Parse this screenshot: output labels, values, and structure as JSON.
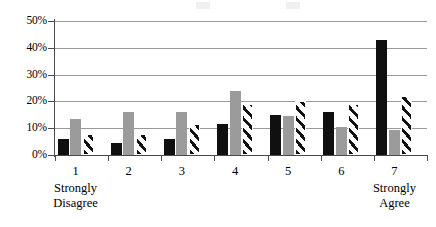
{
  "chart_data": {
    "type": "bar",
    "title": "",
    "subtitle": "",
    "xlabel": "",
    "ylabel": "",
    "categories": [
      "1",
      "2",
      "3",
      "4",
      "5",
      "6",
      "7"
    ],
    "category_endpoint_labels": {
      "low": "Strongly\nDisagree",
      "low_line1": "Strongly",
      "low_line2": "Disagree",
      "high_line1": "Strongly",
      "high_line2": "Agree"
    },
    "ylim": [
      0,
      50
    ],
    "ytick_labels": [
      "0%",
      "10%",
      "20%",
      "30%",
      "40%",
      "50%"
    ],
    "ytick_values": [
      0,
      10,
      20,
      30,
      40,
      50
    ],
    "grid": true,
    "grid_axis": "y",
    "legend_position": "none",
    "series": [
      {
        "name": "Series 1",
        "style": "solid-black",
        "color": "#101010",
        "values": [
          6.0,
          4.5,
          6.0,
          11.5,
          15.0,
          16.0,
          43.0
        ]
      },
      {
        "name": "Series 2",
        "style": "solid-gray",
        "color": "#9b9b9b",
        "values": [
          13.5,
          16.0,
          16.0,
          24.0,
          14.7,
          10.5,
          9.5
        ]
      },
      {
        "name": "Series 3",
        "style": "diagonal-hatch",
        "color": "#ffffff",
        "values": [
          8.0,
          8.0,
          11.5,
          19.0,
          20.0,
          19.0,
          22.0
        ]
      }
    ]
  },
  "axes": {
    "y_unit": "%",
    "y_min_label": "0%",
    "y_max_label": "50%"
  }
}
